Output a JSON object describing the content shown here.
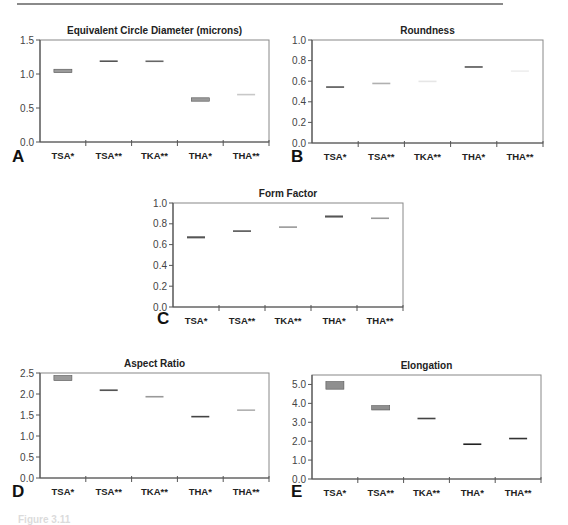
{
  "figure": {
    "caption_partial": "Figure 3.11"
  },
  "chart_data": [
    {
      "id": "A",
      "type": "box",
      "title": "Equivalent Circle Diameter (microns)",
      "panel_label": "A",
      "xlabel": "",
      "ylabel": "",
      "categories": [
        "TSA*",
        "TSA**",
        "TKA**",
        "THA*",
        "THA**"
      ],
      "ylim": [
        0.0,
        1.5
      ],
      "yticks": [
        0.0,
        0.5,
        1.0,
        1.5
      ],
      "ytick_labels": [
        "0.0",
        "0.5",
        "1.0",
        "1.5"
      ],
      "grid": false,
      "legend": null,
      "ranges": [
        {
          "category": "TSA*",
          "low": 1.02,
          "high": 1.07,
          "median": 1.045
        },
        {
          "category": "TSA**",
          "low": 1.18,
          "high": 1.2,
          "median": 1.19
        },
        {
          "category": "TKA**",
          "low": 1.19,
          "high": 1.2,
          "median": 1.19
        },
        {
          "category": "THA*",
          "low": 0.6,
          "high": 0.65,
          "median": 0.625
        },
        {
          "category": "THA**",
          "low": 0.7,
          "high": 0.7,
          "median": 0.7
        }
      ],
      "values": [
        1.05,
        1.19,
        1.19,
        0.62,
        0.7
      ]
    },
    {
      "id": "B",
      "type": "box",
      "title": "Roundness",
      "panel_label": "B",
      "xlabel": "",
      "ylabel": "",
      "categories": [
        "TSA*",
        "TSA**",
        "TKA**",
        "THA*",
        "THA**"
      ],
      "ylim": [
        0.0,
        1.0
      ],
      "yticks": [
        0.0,
        0.2,
        0.4,
        0.6,
        0.8,
        1.0
      ],
      "ytick_labels": [
        "0.0",
        "0.2",
        "0.4",
        "0.6",
        "0.8",
        "1.0"
      ],
      "grid": false,
      "legend": null,
      "ranges": [
        {
          "category": "TSA*",
          "low": 0.54,
          "high": 0.55,
          "median": 0.545
        },
        {
          "category": "TSA**",
          "low": 0.58,
          "high": 0.585,
          "median": 0.58
        },
        {
          "category": "TKA**",
          "low": 0.6,
          "high": 0.6,
          "median": 0.6
        },
        {
          "category": "THA*",
          "low": 0.735,
          "high": 0.745,
          "median": 0.74
        },
        {
          "category": "THA**",
          "low": 0.7,
          "high": 0.7,
          "median": 0.7
        }
      ],
      "values": [
        0.545,
        0.58,
        0.6,
        0.74,
        0.7
      ]
    },
    {
      "id": "C",
      "type": "box",
      "title": "Form Factor",
      "panel_label": "C",
      "xlabel": "",
      "ylabel": "",
      "categories": [
        "TSA*",
        "TSA**",
        "TKA**",
        "THA*",
        "THA**"
      ],
      "ylim": [
        0.0,
        1.0
      ],
      "yticks": [
        0.0,
        0.2,
        0.4,
        0.6,
        0.8,
        1.0
      ],
      "ytick_labels": [
        "0.0",
        "0.2",
        "0.4",
        "0.6",
        "0.8",
        "1.0"
      ],
      "grid": false,
      "legend": null,
      "ranges": [
        {
          "category": "TSA*",
          "low": 0.66,
          "high": 0.68,
          "median": 0.67
        },
        {
          "category": "TSA**",
          "low": 0.725,
          "high": 0.74,
          "median": 0.73
        },
        {
          "category": "TKA**",
          "low": 0.77,
          "high": 0.77,
          "median": 0.77
        },
        {
          "category": "THA*",
          "low": 0.86,
          "high": 0.88,
          "median": 0.87
        },
        {
          "category": "THA**",
          "low": 0.855,
          "high": 0.855,
          "median": 0.855
        }
      ],
      "values": [
        0.67,
        0.73,
        0.77,
        0.87,
        0.855
      ]
    },
    {
      "id": "D",
      "type": "box",
      "title": "Aspect Ratio",
      "panel_label": "D",
      "xlabel": "",
      "ylabel": "",
      "categories": [
        "TSA*",
        "TSA**",
        "TKA**",
        "THA*",
        "THA**"
      ],
      "ylim": [
        0.0,
        2.5
      ],
      "yticks": [
        0.0,
        0.5,
        1.0,
        1.5,
        2.0,
        2.5
      ],
      "ytick_labels": [
        "0.0",
        "0.5",
        "1.0",
        "1.5",
        "2.0",
        "2.5"
      ],
      "grid": false,
      "legend": null,
      "ranges": [
        {
          "category": "TSA*",
          "low": 2.32,
          "high": 2.44,
          "median": 2.38
        },
        {
          "category": "TSA**",
          "low": 2.07,
          "high": 2.11,
          "median": 2.09
        },
        {
          "category": "TKA**",
          "low": 1.94,
          "high": 1.94,
          "median": 1.94
        },
        {
          "category": "THA*",
          "low": 1.45,
          "high": 1.48,
          "median": 1.465
        },
        {
          "category": "THA**",
          "low": 1.62,
          "high": 1.62,
          "median": 1.62
        }
      ],
      "values": [
        2.38,
        2.09,
        1.94,
        1.465,
        1.62
      ]
    },
    {
      "id": "E",
      "type": "box",
      "title": "Elongation",
      "panel_label": "E",
      "xlabel": "",
      "ylabel": "",
      "categories": [
        "TSA*",
        "TSA**",
        "TKA**",
        "THA*",
        "THA**"
      ],
      "ylim": [
        0.0,
        5.5
      ],
      "yticks": [
        0.0,
        1.0,
        2.0,
        3.0,
        4.0,
        5.0
      ],
      "ytick_labels": [
        "0.0",
        "1.0",
        "2.0",
        "3.0",
        "4.0",
        "5.0"
      ],
      "grid": false,
      "legend": null,
      "ranges": [
        {
          "category": "TSA*",
          "low": 4.75,
          "high": 5.15,
          "median": 4.95
        },
        {
          "category": "TSA**",
          "low": 3.65,
          "high": 3.88,
          "median": 3.77
        },
        {
          "category": "TKA**",
          "low": 3.18,
          "high": 3.24,
          "median": 3.21
        },
        {
          "category": "THA*",
          "low": 1.83,
          "high": 1.87,
          "median": 1.85
        },
        {
          "category": "THA**",
          "low": 2.12,
          "high": 2.17,
          "median": 2.15
        }
      ],
      "values": [
        4.95,
        3.77,
        3.21,
        1.85,
        2.15
      ]
    }
  ],
  "layout": {
    "panels": [
      {
        "id": "A",
        "left": 40,
        "top": 40,
        "width": 229,
        "height": 102,
        "title_y": 26,
        "letter_x": 12,
        "letter_y": 162
      },
      {
        "id": "B",
        "left": 312,
        "top": 40,
        "width": 231,
        "height": 103,
        "title_y": 26,
        "letter_x": 291,
        "letter_y": 162
      },
      {
        "id": "C",
        "left": 173,
        "top": 203,
        "width": 230,
        "height": 104,
        "title_y": 189,
        "letter_x": 157,
        "letter_y": 324
      },
      {
        "id": "D",
        "left": 40,
        "top": 373,
        "width": 229,
        "height": 105,
        "title_y": 359,
        "letter_x": 12,
        "letter_y": 497
      },
      {
        "id": "E",
        "left": 312,
        "top": 375,
        "width": 229,
        "height": 104,
        "title_y": 361,
        "letter_x": 291,
        "letter_y": 497
      }
    ],
    "styles": {
      "A": [
        "#9a9a9a",
        "#555555",
        "#666666",
        "#9a9a9a",
        "#c8c8c8"
      ],
      "B": [
        "#555555",
        "#b0b0b0",
        "#e6e6e6",
        "#555555",
        "#eeeeee"
      ],
      "C": [
        "#555555",
        "#555555",
        "#999999",
        "#555555",
        "#999999"
      ],
      "D": [
        "#9a9a9a",
        "#555555",
        "#999999",
        "#444444",
        "#b0b0b0"
      ],
      "E": [
        "#8f8f8f",
        "#8f8f8f",
        "#444444",
        "#222222",
        "#333333"
      ]
    }
  }
}
